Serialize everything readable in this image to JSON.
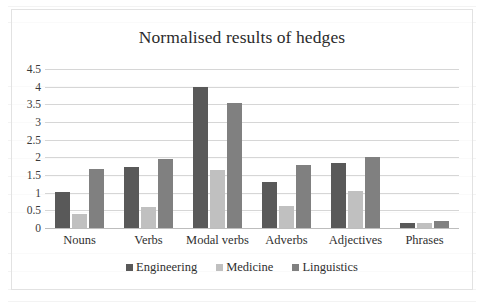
{
  "figure": {
    "title": "Normalised results of hedges"
  },
  "chart_data": {
    "type": "bar",
    "title": "Normalised results of hedges",
    "xlabel": "",
    "ylabel": "",
    "ylim": [
      0,
      4.5
    ],
    "yticks": [
      "0",
      "0.5",
      "1",
      "1.5",
      "2",
      "2.5",
      "3",
      "3.5",
      "4",
      "4.5"
    ],
    "ytick_values": [
      0,
      0.5,
      1,
      1.5,
      2,
      2.5,
      3,
      3.5,
      4,
      4.5
    ],
    "grid": true,
    "legend_position": "bottom",
    "categories": [
      "Nouns",
      "Verbs",
      "Modal verbs",
      "Adverbs",
      "Adjectives",
      "Phrases"
    ],
    "series": [
      {
        "name": "Engineering",
        "color": "#595959",
        "values": [
          1.02,
          1.72,
          4.0,
          1.3,
          1.85,
          0.15
        ]
      },
      {
        "name": "Medicine",
        "color": "#c0c0c0",
        "values": [
          0.39,
          0.6,
          1.65,
          0.62,
          1.04,
          0.13
        ]
      },
      {
        "name": "Linguistics",
        "color": "#808080",
        "values": [
          1.67,
          1.95,
          3.55,
          1.78,
          2.0,
          0.2
        ]
      }
    ]
  }
}
